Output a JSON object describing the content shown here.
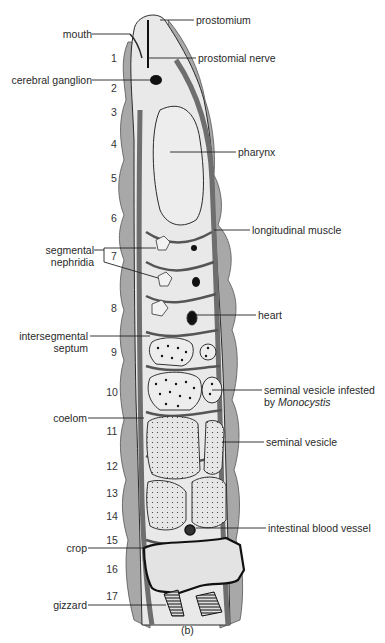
{
  "figure": {
    "caption": "(b)",
    "colors": {
      "body_fill": "#e9e9e9",
      "muscle": "#6e6e6e",
      "muscle_light": "#9a9a9a",
      "outline": "#2b2b2b",
      "ink": "#111111"
    }
  },
  "labels_right": [
    {
      "id": "prostomium",
      "text": "prostomium"
    },
    {
      "id": "prostomial-nerve",
      "text": "prostomial nerve"
    },
    {
      "id": "pharynx",
      "text": "pharynx"
    },
    {
      "id": "longitudinal-muscle",
      "text": "longitudinal muscle"
    },
    {
      "id": "heart",
      "text": "heart"
    },
    {
      "id": "seminal-vesicle-infested",
      "text": "seminal vesicle infested",
      "text2_prefix": "by ",
      "text2_italic": "Monocystis"
    },
    {
      "id": "seminal-vesicle",
      "text": "seminal vesicle"
    },
    {
      "id": "intestinal-blood-vessel",
      "text": "intestinal blood vessel"
    }
  ],
  "labels_left": [
    {
      "id": "mouth",
      "text": "mouth"
    },
    {
      "id": "cerebral-ganglion",
      "text": "cerebral ganglion"
    },
    {
      "id": "segmental-nephridia",
      "text": "segmental",
      "text2": "nephridia"
    },
    {
      "id": "intersegmental-septum",
      "text": "intersegmental",
      "text2": "septum"
    },
    {
      "id": "coelom",
      "text": "coelom"
    },
    {
      "id": "crop",
      "text": "crop"
    },
    {
      "id": "gizzard",
      "text": "gizzard"
    }
  ],
  "segments": [
    "1",
    "2",
    "3",
    "4",
    "5",
    "6",
    "7",
    "8",
    "9",
    "10",
    "11",
    "12",
    "13",
    "14",
    "15",
    "16",
    "17"
  ]
}
